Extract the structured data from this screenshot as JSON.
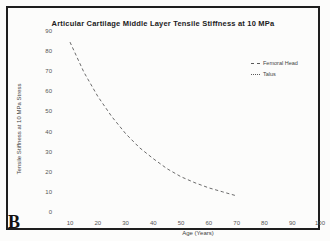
{
  "page": {
    "panel_label": "B"
  },
  "chart_data": {
    "type": "line",
    "title": "Articular Cartilage Middle Layer Tensile Stiffness at 10 MPa",
    "xlabel": "Age (Years)",
    "ylabel": "Tensile Stiffness at 10 MPa Stress",
    "xlim": [
      0,
      105
    ],
    "ylim": [
      0,
      95
    ],
    "x_ticks": [
      10,
      20,
      30,
      40,
      50,
      60,
      70,
      80,
      90,
      100
    ],
    "y_ticks": [
      0,
      10,
      20,
      30,
      40,
      50,
      60,
      70,
      80,
      90
    ],
    "grid": false,
    "legend": {
      "position": "upper-right",
      "entries": [
        {
          "label": "Femoral Head",
          "line_style": "dashed"
        },
        {
          "label": "Talus",
          "line_style": "dotted"
        }
      ]
    },
    "series": [
      {
        "name": "Femoral Head",
        "line_style": "dashed",
        "x": [
          10,
          15,
          20,
          25,
          30,
          35,
          40,
          45,
          50,
          55,
          60,
          65,
          70
        ],
        "y": [
          85,
          70,
          58,
          48,
          39.5,
          32.5,
          27,
          22,
          18,
          15,
          12.5,
          10.5,
          8.5
        ]
      }
    ],
    "line_color": "#5a5a5a",
    "border_color": "#1e1e1e",
    "background_color": "#fcfcfb"
  }
}
